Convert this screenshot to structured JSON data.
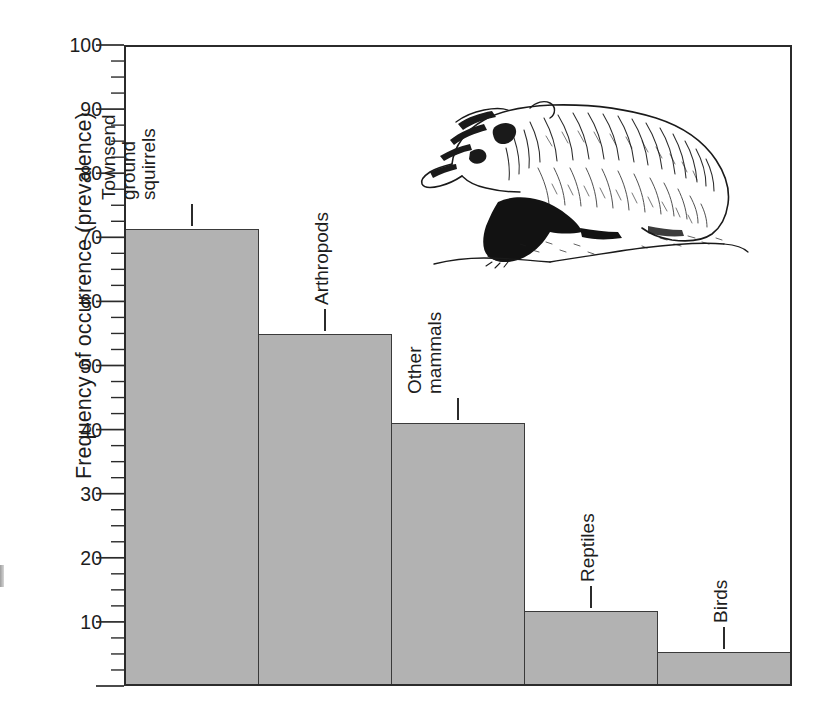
{
  "chart_data": {
    "type": "bar",
    "title": "",
    "subtitle": "",
    "xlabel": "",
    "ylabel": "Frequency of occurrence (prevalence)",
    "categories": [
      "Townsend ground squirrels",
      "Arthropods",
      "Other mammals",
      "Reptiles",
      "Birds"
    ],
    "category_lines": [
      [
        "Townsend",
        "ground",
        "squirrels"
      ],
      [
        "Arthropods"
      ],
      [
        "Other",
        "mammals"
      ],
      [
        "Reptiles"
      ],
      [
        "Birds"
      ]
    ],
    "values": [
      71.5,
      55,
      41,
      11.5,
      5
    ],
    "ylim": [
      0,
      100
    ],
    "ytick_labels": [
      "100",
      "90",
      "80",
      "70",
      "60",
      "50",
      "40",
      "30",
      "20",
      "10"
    ],
    "ytick_values": [
      100,
      90,
      80,
      70,
      60,
      50,
      40,
      30,
      20,
      10
    ],
    "ymajor_step": 10,
    "yminor_step": 2.5,
    "grid": "none",
    "legend": "none",
    "bar_color": "#b2b2b2",
    "bar_edge_color": "#3a3a3a",
    "axis_color": "#2b2b2b",
    "text_color": "#1d1d1d",
    "annotations": [
      {
        "name": "badger-illustration",
        "description": "pen-and-ink line drawing of an American badger standing on ground, facing left"
      }
    ]
  },
  "labels": {
    "leader_lengths_px": [
      22,
      22,
      22,
      22,
      22
    ]
  }
}
